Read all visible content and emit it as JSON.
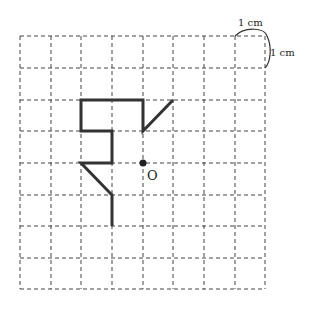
{
  "diagram": {
    "grid": {
      "cols": 8,
      "rows": 8,
      "x_lines": [
        20,
        51,
        81,
        112,
        143,
        173,
        204,
        235,
        265
      ],
      "y_lines": [
        36,
        68,
        100,
        131,
        163,
        195,
        226,
        258,
        289
      ],
      "style": "dashed",
      "color": "#333333"
    },
    "unit_labels": {
      "horizontal": "1 cm",
      "vertical": "1 cm"
    },
    "figure": {
      "color": "#333333",
      "path_grid_points": [
        [
          5,
          2
        ],
        [
          4,
          3
        ],
        [
          4,
          2
        ],
        [
          2,
          2
        ],
        [
          2,
          3
        ],
        [
          3,
          3
        ],
        [
          3,
          4
        ],
        [
          2,
          4
        ],
        [
          3,
          5
        ],
        [
          3,
          6
        ]
      ]
    },
    "center_point": {
      "label": "O",
      "grid_point": [
        4,
        4
      ]
    }
  }
}
